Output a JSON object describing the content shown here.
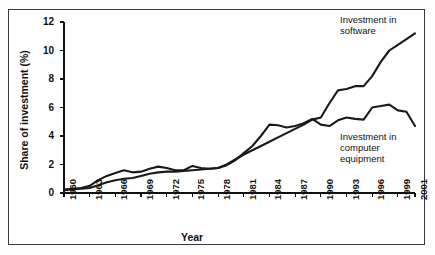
{
  "chart_data": {
    "type": "line",
    "title": "",
    "xlabel": "Year",
    "ylabel": "Share of investment (%)",
    "xlim": [
      1960,
      2001
    ],
    "ylim": [
      0,
      12
    ],
    "grid": false,
    "legend_position": "inline-annotations",
    "ytick_labels": [
      "0",
      "2",
      "4",
      "6",
      "8",
      "10",
      "12"
    ],
    "ytick_values": [
      0,
      2,
      4,
      6,
      8,
      10,
      12
    ],
    "xtick_labels": [
      "1960",
      "1963",
      "1966",
      "1969",
      "1972",
      "1975",
      "1978",
      "1981",
      "1984",
      "1987",
      "1990",
      "1993",
      "1996",
      "1999",
      "2001"
    ],
    "xtick_values": [
      1960,
      1963,
      1966,
      1969,
      1972,
      1975,
      1978,
      1981,
      1984,
      1987,
      1990,
      1993,
      1996,
      1999,
      2001
    ],
    "x": [
      1960,
      1961,
      1962,
      1963,
      1964,
      1965,
      1966,
      1967,
      1968,
      1969,
      1970,
      1971,
      1972,
      1973,
      1974,
      1975,
      1976,
      1977,
      1978,
      1979,
      1980,
      1981,
      1982,
      1983,
      1984,
      1985,
      1986,
      1987,
      1988,
      1989,
      1990,
      1991,
      1992,
      1993,
      1994,
      1995,
      1996,
      1997,
      1998,
      1999,
      2000,
      2001
    ],
    "series": [
      {
        "name": "Investment in software",
        "annotation": "Investment in\nsoftware",
        "color": "#1a1a1a",
        "values": [
          0.2,
          0.25,
          0.3,
          0.35,
          0.55,
          0.75,
          0.9,
          1.0,
          1.05,
          1.2,
          1.35,
          1.45,
          1.5,
          1.5,
          1.55,
          1.6,
          1.65,
          1.7,
          1.75,
          2.0,
          2.35,
          2.7,
          3.0,
          3.3,
          3.6,
          3.9,
          4.2,
          4.5,
          4.8,
          5.15,
          5.3,
          6.3,
          7.2,
          7.3,
          7.5,
          7.5,
          8.2,
          9.2,
          10.0,
          10.4,
          10.8,
          11.2
        ]
      },
      {
        "name": "Investment in computer equipment",
        "annotation": "Investment in\ncomputer\nequipment",
        "color": "#1a1a1a",
        "values": [
          0.25,
          0.3,
          0.35,
          0.5,
          0.9,
          1.2,
          1.4,
          1.6,
          1.45,
          1.5,
          1.7,
          1.85,
          1.75,
          1.6,
          1.6,
          1.9,
          1.75,
          1.7,
          1.75,
          1.95,
          2.3,
          2.8,
          3.3,
          4.0,
          4.8,
          4.75,
          4.6,
          4.7,
          4.9,
          5.2,
          4.8,
          4.7,
          5.1,
          5.3,
          5.2,
          5.15,
          6.0,
          6.1,
          6.2,
          5.8,
          5.7,
          4.7
        ]
      }
    ]
  }
}
